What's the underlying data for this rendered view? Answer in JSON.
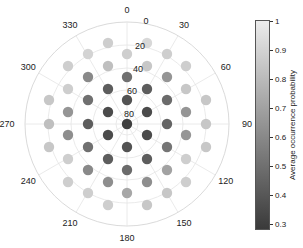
{
  "chart_data": {
    "type": "scatter",
    "subtype": "polar",
    "title": "",
    "colorbar": {
      "label": "Average  occurrence  probability",
      "ticks": [
        1,
        0.9,
        0.8,
        0.7,
        0.6,
        0.5,
        0.4,
        0.3
      ],
      "tick_labels": [
        "1",
        "0.9",
        "0.8",
        "0.7",
        "0.6",
        "0.5",
        "0.4",
        "0.3"
      ],
      "range": [
        0.28,
        1.0
      ],
      "colormap": "gray",
      "color_high": "#ececec",
      "color_low": "#3a3a3a"
    },
    "angular_ticks": [
      "0",
      "30",
      "60",
      "90",
      "120",
      "150",
      "180",
      "210",
      "240",
      "270",
      "300",
      "330"
    ],
    "radial_ticks": [
      "0",
      "20",
      "40",
      "60",
      "80"
    ],
    "radial_note": "radius = elevation; 90 at center, 0 at outer circle",
    "points": [
      {
        "x": 49,
        "y": 100,
        "v": 0.85
      },
      {
        "x": 49,
        "y": 124,
        "v": 0.82
      },
      {
        "x": 49,
        "y": 147,
        "v": 0.85
      },
      {
        "x": 68,
        "y": 66,
        "v": 0.88
      },
      {
        "x": 68,
        "y": 89,
        "v": 0.88
      },
      {
        "x": 68,
        "y": 112,
        "v": 0.65
      },
      {
        "x": 68,
        "y": 135,
        "v": 0.62
      },
      {
        "x": 68,
        "y": 159,
        "v": 0.88
      },
      {
        "x": 68,
        "y": 182,
        "v": 0.88
      },
      {
        "x": 88,
        "y": 54,
        "v": 0.9
      },
      {
        "x": 88,
        "y": 77,
        "v": 0.6
      },
      {
        "x": 88,
        "y": 100,
        "v": 0.5
      },
      {
        "x": 88,
        "y": 124,
        "v": 0.42
      },
      {
        "x": 88,
        "y": 147,
        "v": 0.5
      },
      {
        "x": 88,
        "y": 170,
        "v": 0.6
      },
      {
        "x": 88,
        "y": 193,
        "v": 0.88
      },
      {
        "x": 108,
        "y": 43,
        "v": 0.88
      },
      {
        "x": 108,
        "y": 66,
        "v": 0.82
      },
      {
        "x": 108,
        "y": 89,
        "v": 0.42
      },
      {
        "x": 108,
        "y": 112,
        "v": 0.35
      },
      {
        "x": 108,
        "y": 135,
        "v": 0.35
      },
      {
        "x": 108,
        "y": 159,
        "v": 0.42
      },
      {
        "x": 108,
        "y": 182,
        "v": 0.62
      },
      {
        "x": 108,
        "y": 205,
        "v": 0.88
      },
      {
        "x": 127,
        "y": 54,
        "v": 0.88
      },
      {
        "x": 127,
        "y": 77,
        "v": 0.5
      },
      {
        "x": 127,
        "y": 100,
        "v": 0.38
      },
      {
        "x": 127,
        "y": 124,
        "v": 0.3
      },
      {
        "x": 127,
        "y": 147,
        "v": 0.38
      },
      {
        "x": 127,
        "y": 170,
        "v": 0.48
      },
      {
        "x": 127,
        "y": 193,
        "v": 0.72
      },
      {
        "x": 147,
        "y": 43,
        "v": 0.92
      },
      {
        "x": 147,
        "y": 66,
        "v": 0.85
      },
      {
        "x": 147,
        "y": 89,
        "v": 0.42
      },
      {
        "x": 147,
        "y": 112,
        "v": 0.35
      },
      {
        "x": 147,
        "y": 135,
        "v": 0.35
      },
      {
        "x": 147,
        "y": 159,
        "v": 0.42
      },
      {
        "x": 147,
        "y": 182,
        "v": 0.62
      },
      {
        "x": 147,
        "y": 205,
        "v": 0.85
      },
      {
        "x": 167,
        "y": 54,
        "v": 0.88
      },
      {
        "x": 167,
        "y": 77,
        "v": 0.65
      },
      {
        "x": 167,
        "y": 100,
        "v": 0.48
      },
      {
        "x": 167,
        "y": 124,
        "v": 0.45
      },
      {
        "x": 167,
        "y": 147,
        "v": 0.52
      },
      {
        "x": 167,
        "y": 170,
        "v": 0.7
      },
      {
        "x": 167,
        "y": 193,
        "v": 0.85
      },
      {
        "x": 186,
        "y": 66,
        "v": 0.88
      },
      {
        "x": 186,
        "y": 89,
        "v": 0.85
      },
      {
        "x": 186,
        "y": 112,
        "v": 0.65
      },
      {
        "x": 186,
        "y": 135,
        "v": 0.65
      },
      {
        "x": 186,
        "y": 159,
        "v": 0.88
      },
      {
        "x": 186,
        "y": 182,
        "v": 0.88
      },
      {
        "x": 206,
        "y": 100,
        "v": 0.85
      },
      {
        "x": 206,
        "y": 124,
        "v": 0.85
      },
      {
        "x": 206,
        "y": 147,
        "v": 0.85
      }
    ]
  }
}
